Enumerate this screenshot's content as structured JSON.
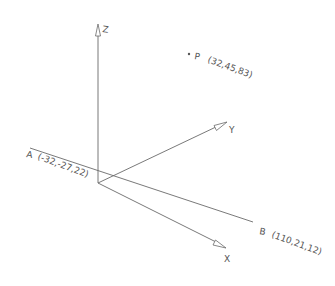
{
  "diagram": {
    "type": "3d-coordinate-axes",
    "axes": {
      "x": {
        "label": "X"
      },
      "y": {
        "label": "Y"
      },
      "z": {
        "label": "Z"
      }
    },
    "points": {
      "A": {
        "name": "A",
        "coords": "(-32,-27,22)"
      },
      "B": {
        "name": "B",
        "coords": "(110,21,12)"
      },
      "P": {
        "name": "P",
        "coords": "(32,45,83)"
      }
    },
    "segments": [
      {
        "from": "A",
        "to": "B"
      }
    ],
    "colors": {
      "line": "#6a6a6a",
      "text": "#555555",
      "background": "#ffffff"
    }
  }
}
